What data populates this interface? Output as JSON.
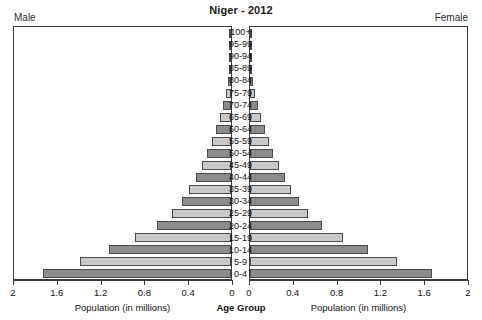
{
  "title": "Niger - 2012",
  "labels": {
    "male": "Male",
    "female": "Female",
    "center_caption": "Age Group",
    "left_caption": "Population (in millions)",
    "right_caption": "Population (in millions)"
  },
  "colors": {
    "bar_dark": "#8c8c8c",
    "bar_light": "#c9c9c9",
    "bar_border": "#4a4a4a",
    "frame": "#3a3a3a",
    "text": "#111111",
    "background": "#ffffff"
  },
  "chart_data": {
    "type": "bar",
    "subtype": "population-pyramid",
    "title": "Niger - 2012",
    "xlabel": "Population (in millions)",
    "ylabel": "Age Group",
    "xlim": [
      0,
      2
    ],
    "xticks": [
      2,
      1.6,
      1.2,
      0.8,
      0.4,
      0
    ],
    "xticklabels_left": [
      "2",
      "1.6",
      "1.2",
      "0.8",
      "0.4",
      "0"
    ],
    "xticklabels_right": [
      "0",
      "0.4",
      "0.8",
      "1.2",
      "1.6",
      "2"
    ],
    "grid": false,
    "legend": "none",
    "categories": [
      "0-4",
      "5-9",
      "10-14",
      "15-19",
      "20-24",
      "25-29",
      "30-34",
      "35-39",
      "40-44",
      "45-49",
      "50-54",
      "55-59",
      "60-64",
      "65-69",
      "70-74",
      "75-79",
      "80-84",
      "85-89",
      "90-94",
      "95-99",
      "100+"
    ],
    "series": [
      {
        "name": "Male",
        "side": "left",
        "values": [
          1.735,
          1.395,
          1.125,
          0.885,
          0.68,
          0.545,
          0.455,
          0.385,
          0.325,
          0.27,
          0.22,
          0.175,
          0.138,
          0.103,
          0.074,
          0.049,
          0.029,
          0.014,
          0.006,
          0.002,
          0.001
        ]
      },
      {
        "name": "Female",
        "side": "right",
        "values": [
          1.68,
          1.355,
          1.09,
          0.86,
          0.665,
          0.535,
          0.45,
          0.38,
          0.32,
          0.265,
          0.215,
          0.172,
          0.136,
          0.102,
          0.073,
          0.049,
          0.029,
          0.014,
          0.006,
          0.002,
          0.001
        ]
      }
    ]
  }
}
